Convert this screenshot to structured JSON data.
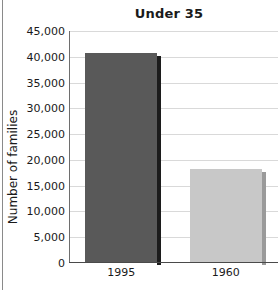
{
  "chart_data": {
    "type": "bar",
    "title": "Under 35",
    "xlabel": "",
    "ylabel": "Number of families",
    "categories": [
      "1995",
      "1960"
    ],
    "values": [
      40500,
      18000
    ],
    "ylim": [
      0,
      45000
    ],
    "yticks": [
      0,
      5000,
      10000,
      15000,
      20000,
      25000,
      30000,
      35000,
      40000,
      45000
    ],
    "ytick_labels": [
      "0",
      "5,000",
      "10,000",
      "15,000",
      "20,000",
      "25,000",
      "30,000",
      "35,000",
      "40,000",
      "45,000"
    ],
    "grid": true,
    "legend": false,
    "series": [
      {
        "name": "Number of families",
        "values": [
          40500,
          18000
        ],
        "bar_colors": [
          "#595959",
          "#c8c8c8"
        ],
        "shadow_colors": [
          "#1c1c1c",
          "#9a9a9a"
        ]
      }
    ]
  },
  "colors": {
    "bar_1995": "#595959",
    "bar_1960": "#c8c8c8",
    "shadow_1995": "#1c1c1c",
    "shadow_1960": "#9a9a9a",
    "gridline": "#d9d9d9",
    "axis": "#4a4a4a",
    "text": "#1a1a1a",
    "background": "#ffffff"
  }
}
